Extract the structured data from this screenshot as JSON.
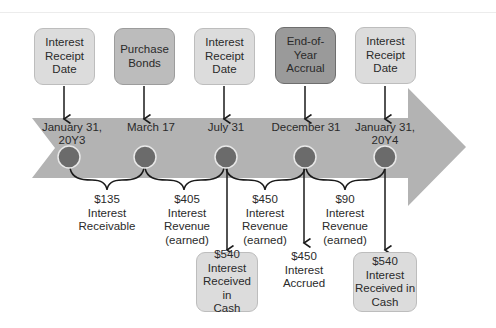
{
  "diagram": {
    "top_boxes": [
      {
        "id": "jan31-y3",
        "text": "Interest\nReceipt\nDate",
        "shade": "light"
      },
      {
        "id": "mar17",
        "text": "Purchase\nBonds",
        "shade": "mid"
      },
      {
        "id": "jul31",
        "text": "Interest\nReceipt\nDate",
        "shade": "light"
      },
      {
        "id": "dec31",
        "text": "End-of-\nYear\nAccrual",
        "shade": "dark"
      },
      {
        "id": "jan31-y4",
        "text": "Interest\nReceipt\nDate",
        "shade": "light"
      }
    ],
    "timeline_dates": [
      "January 31,\n20Y3",
      "March 17",
      "July 31",
      "December 31",
      "January 31,\n20Y4"
    ],
    "period_labels": [
      "$135\nInterest\nReceivable",
      "$405\nInterest\nRevenue\n(earned)",
      "$450\nInterest\nRevenue\n(earned)",
      "$90\nInterest\nRevenue\n(earned)"
    ],
    "bottom_items": [
      {
        "id": "jul31-cash",
        "text": "$540\nInterest\nReceived in\nCash",
        "boxed": true
      },
      {
        "id": "dec31-accrued",
        "text": "$450\nInterest\nAccrued",
        "boxed": false
      },
      {
        "id": "jan31-y4-cash",
        "text": "$540\nInterest\nReceived in\nCash",
        "boxed": true
      }
    ],
    "colors": {
      "band": "#b3b3b3",
      "circle": "#6b6b6b",
      "circle_ring": "#e8e8e8",
      "line": "#1a1a1a"
    }
  }
}
